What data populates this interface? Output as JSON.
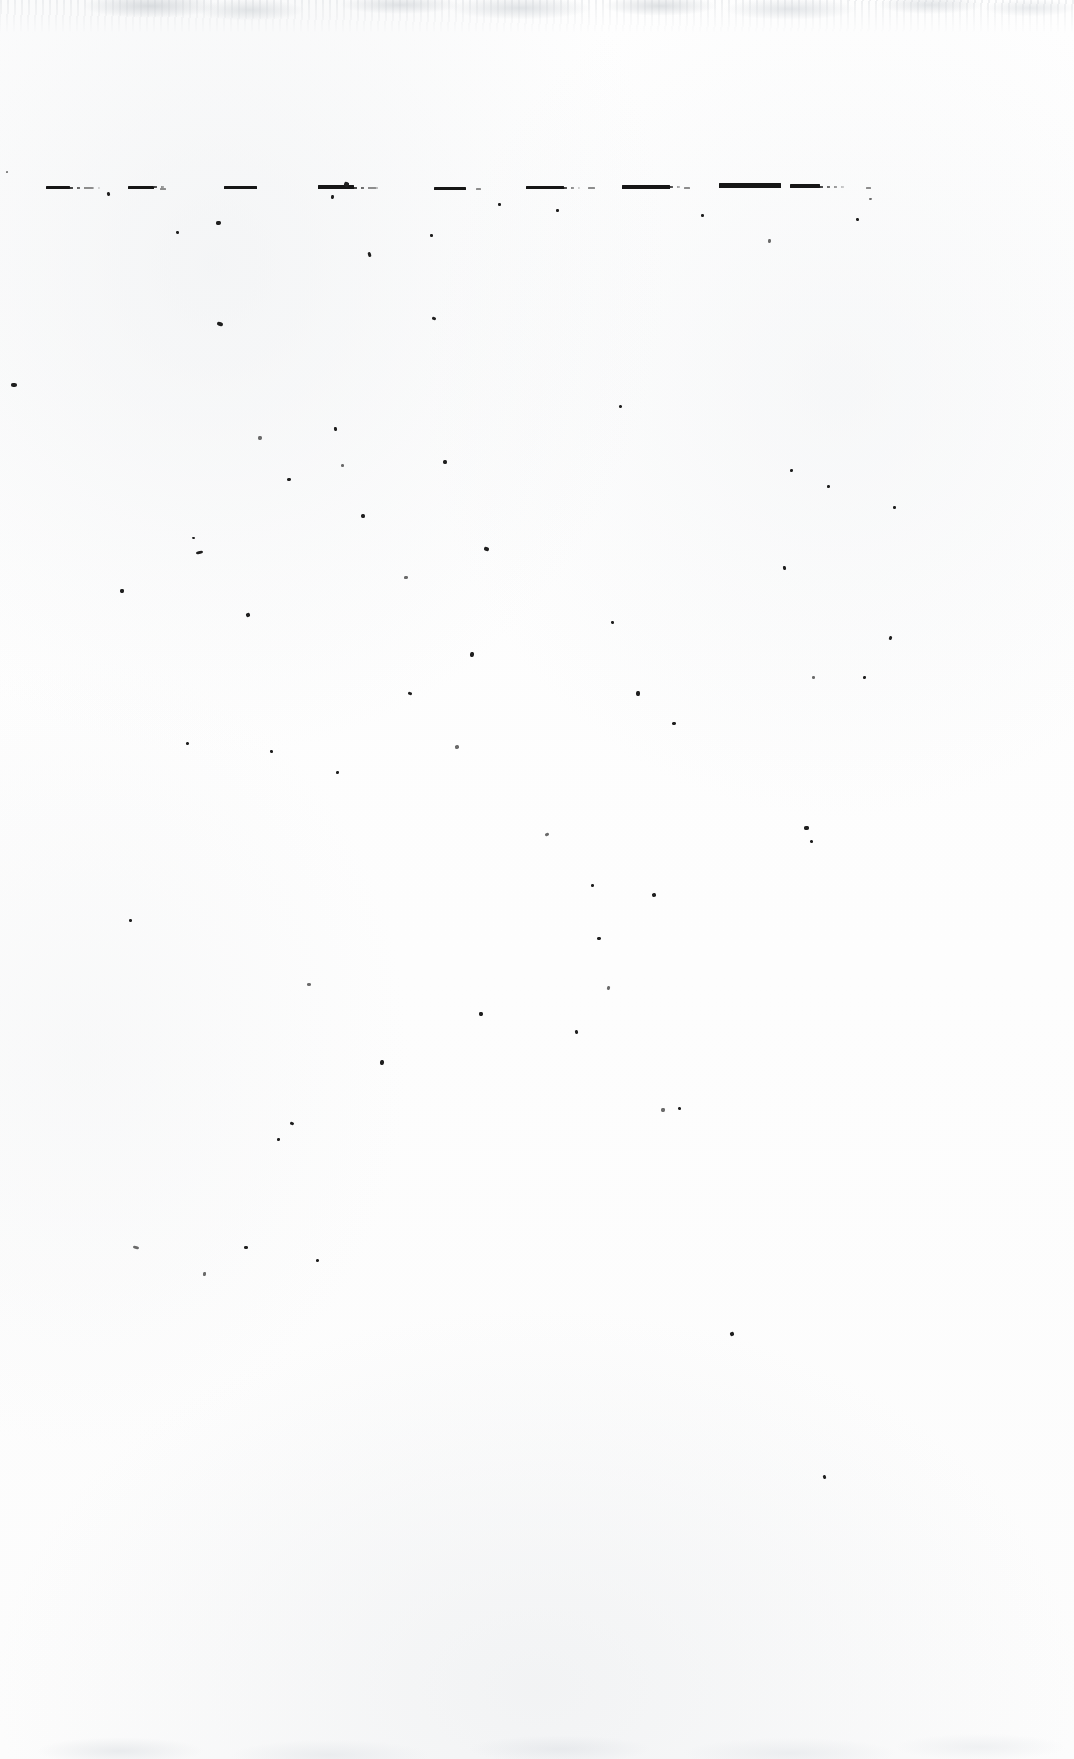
{
  "document": {
    "kind": "scanned-page",
    "condition": "severely faded / degraded",
    "page_width": 1074,
    "page_height": 1759,
    "background_color": "#fefefe",
    "ink_color": "#161616",
    "visible_text": "",
    "note": "No legible characters survive; only residual baseline strokes."
  },
  "text_line": {
    "baseline_y": 188,
    "marks": [
      {
        "id": "mark-1",
        "x": 46,
        "y": 186,
        "w": 24,
        "h": 3,
        "tone": "dark",
        "trail_w": 30
      },
      {
        "id": "mark-2",
        "x": 128,
        "y": 186,
        "w": 26,
        "h": 2.5,
        "tone": "dark",
        "trail_w": 14
      },
      {
        "id": "mark-3",
        "x": 224,
        "y": 186,
        "w": 33,
        "h": 3,
        "tone": "dark",
        "trail_w": 0
      },
      {
        "id": "mark-4",
        "x": 318,
        "y": 185,
        "w": 36,
        "h": 4,
        "tone": "dark",
        "trail_w": 28
      },
      {
        "id": "mark-5",
        "x": 434,
        "y": 187,
        "w": 32,
        "h": 2.5,
        "tone": "dark",
        "trail_w": 0
      },
      {
        "id": "mark-6",
        "x": 526,
        "y": 186,
        "w": 38,
        "h": 3,
        "tone": "dark",
        "trail_w": 16
      },
      {
        "id": "mark-7",
        "x": 622,
        "y": 185,
        "w": 48,
        "h": 3.5,
        "tone": "dark",
        "trail_w": 12
      },
      {
        "id": "mark-8",
        "x": 719,
        "y": 183,
        "w": 62,
        "h": 4.5,
        "tone": "dark",
        "trail_w": 0
      },
      {
        "id": "mark-9",
        "x": 790,
        "y": 184,
        "w": 30,
        "h": 4,
        "tone": "dark",
        "trail_w": 26
      }
    ],
    "faint_marks": [
      {
        "id": "faint-1",
        "x": 84,
        "y": 187,
        "w": 9,
        "h": 2
      },
      {
        "id": "faint-2",
        "x": 160,
        "y": 188,
        "w": 6,
        "h": 1.5
      },
      {
        "id": "faint-3",
        "x": 368,
        "y": 187,
        "w": 8,
        "h": 1.5
      },
      {
        "id": "faint-4",
        "x": 476,
        "y": 188,
        "w": 5,
        "h": 1.5
      },
      {
        "id": "faint-5",
        "x": 588,
        "y": 187,
        "w": 7,
        "h": 1.5
      },
      {
        "id": "faint-6",
        "x": 684,
        "y": 187,
        "w": 6,
        "h": 1.5
      },
      {
        "id": "faint-7",
        "x": 866,
        "y": 187,
        "w": 5,
        "h": 1.5
      }
    ]
  },
  "specks": [
    {
      "x": 6,
      "y": 171,
      "w": 2,
      "h": 2
    },
    {
      "x": 11,
      "y": 383,
      "w": 6,
      "h": 4
    },
    {
      "x": 107,
      "y": 192,
      "w": 3,
      "h": 4
    },
    {
      "x": 120,
      "y": 589,
      "w": 4,
      "h": 4
    },
    {
      "x": 129,
      "y": 919,
      "w": 3,
      "h": 3
    },
    {
      "x": 133,
      "y": 1246,
      "w": 6,
      "h": 3
    },
    {
      "x": 176,
      "y": 231,
      "w": 3,
      "h": 3
    },
    {
      "x": 186,
      "y": 742,
      "w": 3,
      "h": 3
    },
    {
      "x": 192,
      "y": 537,
      "w": 3,
      "h": 2
    },
    {
      "x": 196,
      "y": 551,
      "w": 7,
      "h": 3
    },
    {
      "x": 203,
      "y": 1272,
      "w": 3,
      "h": 4
    },
    {
      "x": 216,
      "y": 221,
      "w": 5,
      "h": 4
    },
    {
      "x": 217,
      "y": 322,
      "w": 6,
      "h": 4
    },
    {
      "x": 244,
      "y": 1246,
      "w": 4,
      "h": 3
    },
    {
      "x": 246,
      "y": 613,
      "w": 4,
      "h": 4
    },
    {
      "x": 258,
      "y": 436,
      "w": 4,
      "h": 4
    },
    {
      "x": 270,
      "y": 750,
      "w": 3,
      "h": 3
    },
    {
      "x": 277,
      "y": 1138,
      "w": 3,
      "h": 3
    },
    {
      "x": 287,
      "y": 478,
      "w": 4,
      "h": 3
    },
    {
      "x": 290,
      "y": 1122,
      "w": 4,
      "h": 3
    },
    {
      "x": 307,
      "y": 983,
      "w": 4,
      "h": 3
    },
    {
      "x": 316,
      "y": 1259,
      "w": 3,
      "h": 3
    },
    {
      "x": 331,
      "y": 195,
      "w": 3,
      "h": 4
    },
    {
      "x": 334,
      "y": 427,
      "w": 3,
      "h": 4
    },
    {
      "x": 336,
      "y": 771,
      "w": 3,
      "h": 3
    },
    {
      "x": 341,
      "y": 464,
      "w": 3,
      "h": 3
    },
    {
      "x": 344,
      "y": 182,
      "w": 5,
      "h": 5
    },
    {
      "x": 361,
      "y": 514,
      "w": 4,
      "h": 4
    },
    {
      "x": 368,
      "y": 252,
      "w": 3,
      "h": 5
    },
    {
      "x": 380,
      "y": 1060,
      "w": 4,
      "h": 5
    },
    {
      "x": 404,
      "y": 576,
      "w": 4,
      "h": 3
    },
    {
      "x": 408,
      "y": 692,
      "w": 4,
      "h": 3
    },
    {
      "x": 430,
      "y": 234,
      "w": 3,
      "h": 3
    },
    {
      "x": 432,
      "y": 317,
      "w": 4,
      "h": 3
    },
    {
      "x": 443,
      "y": 460,
      "w": 4,
      "h": 4
    },
    {
      "x": 455,
      "y": 745,
      "w": 4,
      "h": 4
    },
    {
      "x": 470,
      "y": 652,
      "w": 4,
      "h": 5
    },
    {
      "x": 479,
      "y": 1012,
      "w": 4,
      "h": 4
    },
    {
      "x": 484,
      "y": 547,
      "w": 5,
      "h": 4
    },
    {
      "x": 498,
      "y": 203,
      "w": 3,
      "h": 3
    },
    {
      "x": 545,
      "y": 833,
      "w": 4,
      "h": 3
    },
    {
      "x": 556,
      "y": 209,
      "w": 3,
      "h": 3
    },
    {
      "x": 575,
      "y": 1030,
      "w": 3,
      "h": 4
    },
    {
      "x": 591,
      "y": 884,
      "w": 3,
      "h": 3
    },
    {
      "x": 597,
      "y": 937,
      "w": 4,
      "h": 3
    },
    {
      "x": 607,
      "y": 986,
      "w": 3,
      "h": 4
    },
    {
      "x": 611,
      "y": 621,
      "w": 3,
      "h": 3
    },
    {
      "x": 619,
      "y": 405,
      "w": 3,
      "h": 3
    },
    {
      "x": 636,
      "y": 691,
      "w": 4,
      "h": 5
    },
    {
      "x": 652,
      "y": 893,
      "w": 4,
      "h": 4
    },
    {
      "x": 661,
      "y": 1108,
      "w": 4,
      "h": 4
    },
    {
      "x": 672,
      "y": 722,
      "w": 4,
      "h": 3
    },
    {
      "x": 678,
      "y": 1107,
      "w": 3,
      "h": 3
    },
    {
      "x": 701,
      "y": 214,
      "w": 3,
      "h": 3
    },
    {
      "x": 730,
      "y": 1332,
      "w": 4,
      "h": 4
    },
    {
      "x": 768,
      "y": 239,
      "w": 3,
      "h": 4
    },
    {
      "x": 783,
      "y": 566,
      "w": 3,
      "h": 4
    },
    {
      "x": 790,
      "y": 469,
      "w": 3,
      "h": 3
    },
    {
      "x": 804,
      "y": 826,
      "w": 5,
      "h": 4
    },
    {
      "x": 810,
      "y": 840,
      "w": 3,
      "h": 3
    },
    {
      "x": 812,
      "y": 676,
      "w": 3,
      "h": 3
    },
    {
      "x": 823,
      "y": 1475,
      "w": 3,
      "h": 4
    },
    {
      "x": 827,
      "y": 485,
      "w": 3,
      "h": 3
    },
    {
      "x": 856,
      "y": 218,
      "w": 3,
      "h": 3
    },
    {
      "x": 863,
      "y": 676,
      "w": 3,
      "h": 3
    },
    {
      "x": 869,
      "y": 198,
      "w": 3,
      "h": 2
    },
    {
      "x": 889,
      "y": 636,
      "w": 3,
      "h": 4
    },
    {
      "x": 893,
      "y": 506,
      "w": 3,
      "h": 3
    }
  ]
}
